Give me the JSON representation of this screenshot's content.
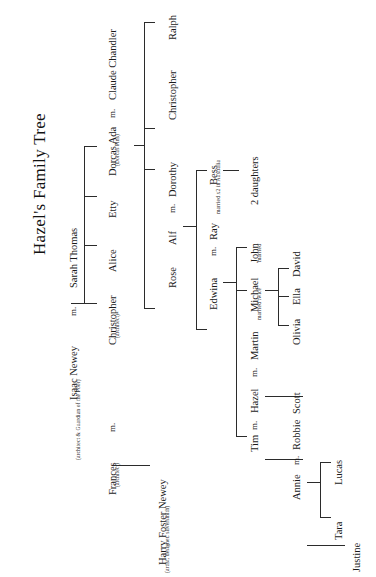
{
  "document": {
    "title": "Hazel's Family Tree",
    "type": "family-tree-chart",
    "orientation": "text rotated 90 degrees counter-clockwise",
    "background_color": "#ffffff",
    "line_color": "#2b2b2b",
    "text_color": "#1a1a1a"
  },
  "generations": {
    "g1": {
      "label": "founding couple",
      "people": [
        {
          "name": "Isaac Newey",
          "note": "(architect & Guardian of the Poor)"
        },
        {
          "name": "Sarah Thomas",
          "note": ""
        }
      ],
      "marriage_marker": "m."
    },
    "g2": {
      "label": "children of Isaac & Sarah",
      "people": [
        {
          "name": "Christopher",
          "note": "(architect)"
        },
        {
          "name": "Alice",
          "note": ""
        },
        {
          "name": "Etty",
          "note": ""
        },
        {
          "name": "Dorcas Ada",
          "note": "(Dorcas Pins)"
        }
      ]
    },
    "g2_spouses": [
      {
        "name": "Frances",
        "note": "(architect)",
        "marriage_marker": "m.",
        "spouse_of": "Christopher"
      },
      {
        "name": "Claude Chandler",
        "note": "",
        "marriage_marker": "m.",
        "spouse_of": "Dorcas Ada"
      }
    ],
    "g3": {
      "label": "third generation",
      "people": [
        {
          "name": "Harry Foster Newey",
          "note": "(artist, designer, silversmith)"
        },
        {
          "name": "Rose",
          "note": ""
        },
        {
          "name": "Alf",
          "note": ""
        },
        {
          "name": "Christopher",
          "note": ""
        },
        {
          "name": "Ralph",
          "note": ""
        }
      ]
    },
    "g3_spouses": [
      {
        "name": "Dorothy",
        "note": "",
        "marriage_marker": "m.",
        "spouse_of": "Alf"
      }
    ],
    "g4": {
      "label": "fourth generation",
      "people": [
        {
          "name": "Edwina",
          "note": ""
        },
        {
          "name": "Ray",
          "note": ""
        },
        {
          "name": "Bess",
          "note": "married x2 in Australia"
        }
      ],
      "marriage_marker": "m."
    },
    "g5": {
      "label": "fifth generation",
      "people": [
        {
          "name": "Tim",
          "note": ""
        },
        {
          "name": "Hazel",
          "note": ""
        },
        {
          "name": "Michael",
          "note": "married twice"
        },
        {
          "name": "John",
          "note": "married"
        },
        {
          "name": "2 daughters",
          "note": ""
        }
      ],
      "marriage_marker": "m."
    },
    "g5_spouses": [
      {
        "name": "Martin",
        "note": "",
        "marriage_marker": "m.",
        "spouse_of": "Hazel"
      }
    ],
    "g6": {
      "label": "sixth generation",
      "people": [
        {
          "name": "Annie",
          "note": ""
        },
        {
          "name": "Scott",
          "note": ""
        },
        {
          "name": "Olivia",
          "note": ""
        },
        {
          "name": "Ella",
          "note": ""
        },
        {
          "name": "David",
          "note": ""
        }
      ],
      "marriage_marker": "m."
    },
    "g6_spouses": [
      {
        "name": "Robbie",
        "note": "",
        "marriage_marker": "m.",
        "spouse_of": "Annie"
      }
    ],
    "g7": {
      "label": "seventh generation",
      "people": [
        {
          "name": "Justine",
          "note": ""
        },
        {
          "name": "Tara",
          "note": ""
        },
        {
          "name": "Lucas",
          "note": ""
        }
      ]
    }
  },
  "labels": {
    "title": "Hazel's Family Tree",
    "isaac": "Isaac Newey",
    "isaac_note": "(architect & Guardian of the Poor)",
    "m_isaac": "m.",
    "sarah": "Sarah Thomas",
    "christopher_g2": "Christopher",
    "christopher_g2_note": "(architect)",
    "alice": "Alice",
    "etty": "Etty",
    "dorcas": "Dorcas Ada",
    "dorcas_note": "(Dorcas Pins)",
    "m_dorcas": "m.",
    "claude": "Claude Chandler",
    "frances": "Frances",
    "frances_note": "(architect)",
    "m_frances": "m.",
    "harry": "Harry Foster Newey",
    "harry_note": "(artist, designer, silversmith)",
    "rose": "Rose",
    "alf": "Alf",
    "m_alf": "m.",
    "dorothy": "Dorothy",
    "christopher_g3": "Christopher",
    "ralph": "Ralph",
    "edwina": "Edwina",
    "m_edwina": "m.",
    "ray": "Ray",
    "bess": "Bess",
    "bess_note": "married x2 in Australia",
    "two_daughters": "2 daughters",
    "john": "John",
    "john_note": "married",
    "michael": "Michael",
    "michael_note": "married twice",
    "tim": "Tim",
    "m_tim": "m.",
    "hazel": "Hazel",
    "m_hazel": "m.",
    "martin": "Martin",
    "scott": "Scott",
    "olivia": "Olivia",
    "ella": "Ella",
    "david": "David",
    "annie": "Annie",
    "m_annie": "m.",
    "robbie": "Robbie",
    "justine": "Justine",
    "tara": "Tara",
    "lucas": "Lucas"
  }
}
